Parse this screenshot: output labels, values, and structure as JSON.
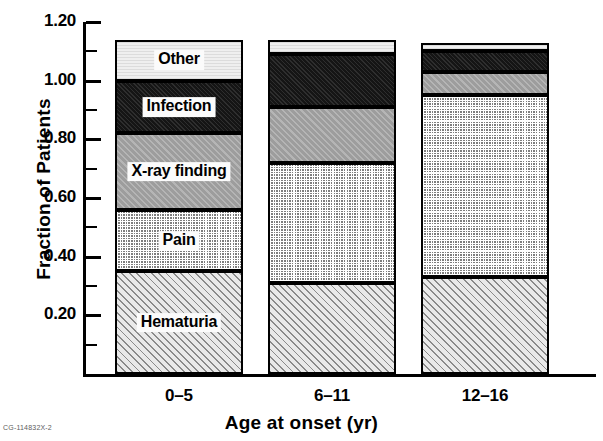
{
  "figure": {
    "code": "CG-114832X-2"
  },
  "axes": {
    "ylabel": "Fraction of Patients",
    "xlabel": "Age at onset (yr)",
    "ytick_labels": [
      "1.20",
      "1.00",
      "0.80",
      "0.60",
      "0.40",
      "0.20"
    ],
    "ytick_values": [
      1.2,
      1.0,
      0.8,
      0.6,
      0.4,
      0.2
    ]
  },
  "segments": [
    {
      "key": "hematuria",
      "label": "Hematuria",
      "pattern": "p-hatch"
    },
    {
      "key": "pain",
      "label": "Pain",
      "pattern": "p-check"
    },
    {
      "key": "xray",
      "label": "X-ray finding",
      "pattern": "p-gray"
    },
    {
      "key": "infection",
      "label": "Infection",
      "pattern": "p-solid"
    },
    {
      "key": "other",
      "label": "Other",
      "pattern": "p-light"
    }
  ],
  "chart_data": {
    "type": "bar",
    "title": "",
    "subtitle": "",
    "stacked": true,
    "orientation": "vertical",
    "xlabel": "Age at onset (yr)",
    "ylabel": "Fraction of Patients",
    "categories": [
      "0–5",
      "6–11",
      "12–16"
    ],
    "ylim": [
      0,
      1.2
    ],
    "ytick_step": 0.2,
    "minor_ticks": true,
    "grid": false,
    "legend": "in-bar labels",
    "series": [
      {
        "name": "Hematuria",
        "values": [
          0.35,
          0.31,
          0.33
        ]
      },
      {
        "name": "Pain",
        "values": [
          0.21,
          0.41,
          0.62
        ]
      },
      {
        "name": "X-ray finding",
        "values": [
          0.26,
          0.19,
          0.08
        ]
      },
      {
        "name": "Infection",
        "values": [
          0.18,
          0.18,
          0.07
        ]
      },
      {
        "name": "Other",
        "values": [
          0.14,
          0.05,
          0.03
        ]
      }
    ],
    "cumulative_tops": [
      [
        0.35,
        0.56,
        0.82,
        1.0,
        1.14
      ],
      [
        0.31,
        0.72,
        0.91,
        1.09,
        1.14
      ],
      [
        0.33,
        0.95,
        1.03,
        1.1,
        1.13
      ]
    ],
    "bar_totals": [
      1.14,
      1.14,
      1.13
    ],
    "annotations": [
      "CG-114832X-2"
    ]
  },
  "bar_labels_visible": [
    [
      "Hematuria",
      "Pain",
      "X-ray finding",
      "Infection",
      "Other"
    ],
    [],
    []
  ]
}
